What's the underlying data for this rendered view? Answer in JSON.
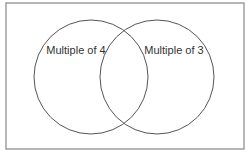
{
  "diagram": {
    "type": "venn",
    "universe": {
      "x": 6,
      "y": 3,
      "width": 238,
      "height": 146,
      "stroke": "#888888"
    },
    "sets": [
      {
        "label": "Multiple of 4",
        "cx": 91,
        "cy": 77,
        "r": 57,
        "label_x": 76,
        "label_y": 54
      },
      {
        "label": "Multiple of 3",
        "cx": 157,
        "cy": 77,
        "r": 57,
        "label_x": 174,
        "label_y": 54
      }
    ],
    "stroke_color": "#555555"
  }
}
